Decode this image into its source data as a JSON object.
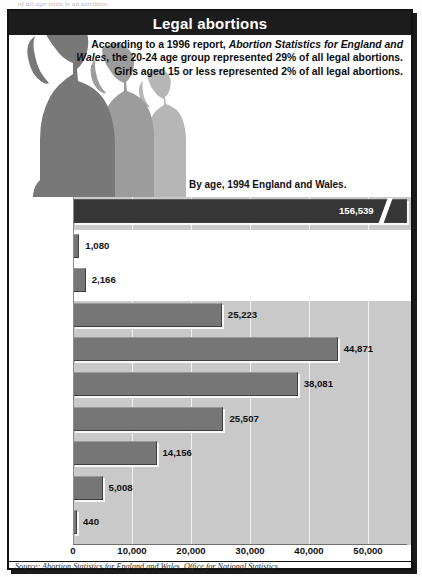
{
  "clipped_top_text": "of all age units is an attribute.",
  "title": "Legal abortions",
  "intro": {
    "part1": "According to a 1996 report, ",
    "italic": "Abortion Statistics for England and Wales",
    "part2": ", the 20-24 age group represented 29% of all legal abortions. Girls aged 15 or less represented 2% of all legal abortions."
  },
  "subtitle": "By age, 1994 England and Wales.",
  "source": "Source: Abortion Statistics for England and Wales. Office for National Statistics",
  "colors": {
    "title_bar": "#1c1c1c",
    "plot_background": "#c9c9c9",
    "bar": "#767676",
    "bar_total": "#363636",
    "gridline": "#f2f2f2",
    "text": "#111111"
  },
  "chart_data": {
    "type": "bar",
    "orientation": "horizontal",
    "title": "Legal abortions",
    "subtitle": "By age, 1994 England and Wales.",
    "xlabel": "",
    "ylabel": "",
    "xlim": [
      0,
      56000
    ],
    "xticks": [
      0,
      10000,
      20000,
      30000,
      40000,
      50000
    ],
    "xtick_labels": [
      "0",
      "10,000",
      "20,000",
      "30,000",
      "40,000",
      "50,000"
    ],
    "grid": true,
    "legend": "none",
    "axis_break": {
      "present": true,
      "applies_to": "All ages",
      "note": "bar truncated with diagonal break; true value 156,539 exceeds axis range"
    },
    "categories": [
      "All ages",
      "Under 15",
      "15",
      "16-19",
      "20-24",
      "25-29",
      "30-34",
      "35-39",
      "40-44",
      "45 +"
    ],
    "values": [
      156539,
      1080,
      2166,
      25223,
      44871,
      38081,
      25507,
      14156,
      5008,
      440
    ],
    "value_labels": [
      "156,539",
      "1,080",
      "2,166",
      "25,223",
      "44,871",
      "38,081",
      "25,507",
      "14,156",
      "5,008",
      "440"
    ],
    "rows": [
      {
        "label": "All ages",
        "value": 156539,
        "value_label": "156,539",
        "broken": true,
        "label_inside": true,
        "white_strip": false
      },
      {
        "label": "Under 15",
        "value": 1080,
        "value_label": "1,080",
        "broken": false,
        "label_inside": false,
        "white_strip": true
      },
      {
        "label": "15",
        "value": 2166,
        "value_label": "2,166",
        "broken": false,
        "label_inside": false,
        "white_strip": true
      },
      {
        "label": "16-19",
        "value": 25223,
        "value_label": "25,223",
        "broken": false,
        "label_inside": false,
        "white_strip": false
      },
      {
        "label": "20-24",
        "value": 44871,
        "value_label": "44,871",
        "broken": false,
        "label_inside": false,
        "white_strip": false
      },
      {
        "label": "25-29",
        "value": 38081,
        "value_label": "38,081",
        "broken": false,
        "label_inside": false,
        "white_strip": false
      },
      {
        "label": "30-34",
        "value": 25507,
        "value_label": "25,507",
        "broken": false,
        "label_inside": false,
        "white_strip": false
      },
      {
        "label": "35-39",
        "value": 14156,
        "value_label": "14,156",
        "broken": false,
        "label_inside": false,
        "white_strip": false
      },
      {
        "label": "40-44",
        "value": 5008,
        "value_label": "5,008",
        "broken": false,
        "label_inside": false,
        "white_strip": false
      },
      {
        "label": "45 +",
        "value": 440,
        "value_label": "440",
        "broken": false,
        "label_inside": false,
        "white_strip": false
      }
    ]
  }
}
